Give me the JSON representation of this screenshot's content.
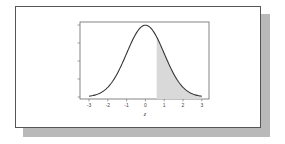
{
  "chart_data": {
    "type": "area",
    "title": "",
    "xlabel": "z",
    "ylabel": "",
    "xlim": [
      -3.4,
      3.4
    ],
    "ylim": [
      0,
      0.42
    ],
    "x_ticks": [
      -3,
      -2,
      -1,
      0,
      1,
      2,
      3
    ],
    "x_tick_labels": [
      "-3",
      "-2",
      "-1",
      "0",
      "1",
      "2",
      "3"
    ],
    "y_ticks": [
      0,
      0.1,
      0.2,
      0.3,
      0.4
    ],
    "y_tick_labels": [
      "",
      "",
      "",
      "",
      ""
    ],
    "grid": false,
    "legend": null,
    "series": [
      {
        "name": "standard normal density",
        "function": "phi(z) = exp(-z^2/2)/sqrt(2*pi)",
        "x": [
          -3,
          -2.5,
          -2,
          -1.5,
          -1,
          -0.5,
          0,
          0.5,
          1,
          1.5,
          2,
          2.5,
          3
        ],
        "values": [
          0.004,
          0.018,
          0.054,
          0.13,
          0.242,
          0.352,
          0.399,
          0.352,
          0.242,
          0.13,
          0.054,
          0.018,
          0.004
        ],
        "color": "#333333"
      }
    ],
    "shaded_region": {
      "from": 0.6,
      "to": 3,
      "color": "#d9d9d9",
      "description": "upper-tail area under the curve"
    }
  },
  "labels": {
    "x_axis": "z",
    "ticks": [
      "-3",
      "-2",
      "-1",
      "0",
      "1",
      "2",
      "3"
    ]
  }
}
